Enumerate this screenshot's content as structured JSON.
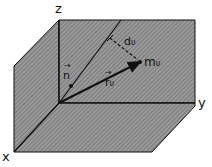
{
  "diagram": {
    "axes": {
      "x": "x",
      "y": "y",
      "z": "z"
    },
    "vectors": {
      "n": {
        "label": "n",
        "arrow": "→"
      },
      "r": {
        "label": "r",
        "sub": "υ",
        "arrow": "→"
      }
    },
    "point": {
      "label": "m",
      "sub": "υ"
    },
    "distance": {
      "label": "d",
      "sub": "υ"
    },
    "colors": {
      "fill": "#8a8a8a",
      "line": "#111111"
    }
  }
}
